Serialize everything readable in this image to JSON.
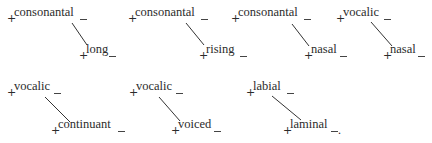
{
  "pairs": [
    {
      "upper": "consonantal",
      "lower": "long"
    },
    {
      "upper": "consonantal",
      "lower": "rising"
    },
    {
      "upper": "consonantal",
      "lower": "nasal"
    },
    {
      "upper": "vocalic",
      "lower": "nasal"
    },
    {
      "upper": "vocalic",
      "lower": "continuant"
    },
    {
      "upper": "vocalic",
      "lower": "voiced"
    },
    {
      "upper": "labial",
      "lower": "laminal"
    }
  ],
  "sign": "+",
  "terminal_punctuation": "."
}
